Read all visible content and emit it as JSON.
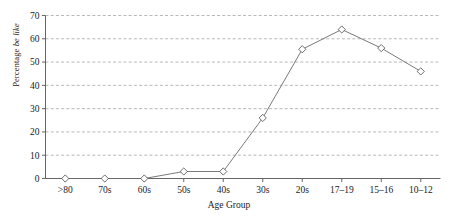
{
  "chart_data": {
    "type": "line",
    "title": "",
    "xlabel": "Age Group",
    "ylabel_plain": "Percentage ",
    "ylabel_italic": "be like",
    "categories": [
      ">80",
      "70s",
      "60s",
      "50s",
      "40s",
      "30s",
      "20s",
      "17–19",
      "15–16",
      "10–12"
    ],
    "values": [
      0,
      0,
      0,
      3,
      3,
      26,
      55.5,
      64,
      56,
      46
    ],
    "series": [
      {
        "name": "Percentage be like",
        "values": [
          0,
          0,
          0,
          3,
          3,
          26,
          55.5,
          64,
          56,
          46
        ]
      }
    ],
    "ylim": [
      0,
      70
    ],
    "ytick_values": [
      0,
      10,
      20,
      30,
      40,
      50,
      60,
      70
    ],
    "ytick_labels": [
      "0",
      "10",
      "20",
      "30",
      "40",
      "50",
      "60",
      "70"
    ],
    "grid": "horizontal-dashed",
    "legend": "none",
    "marker": "open-diamond",
    "line_color": "#6b6b6b",
    "marker_fill": "#ffffff",
    "marker_stroke": "#4a4a4a",
    "grid_color": "#9a9a9a",
    "axis_color": "#555555",
    "background": "#ffffff"
  }
}
